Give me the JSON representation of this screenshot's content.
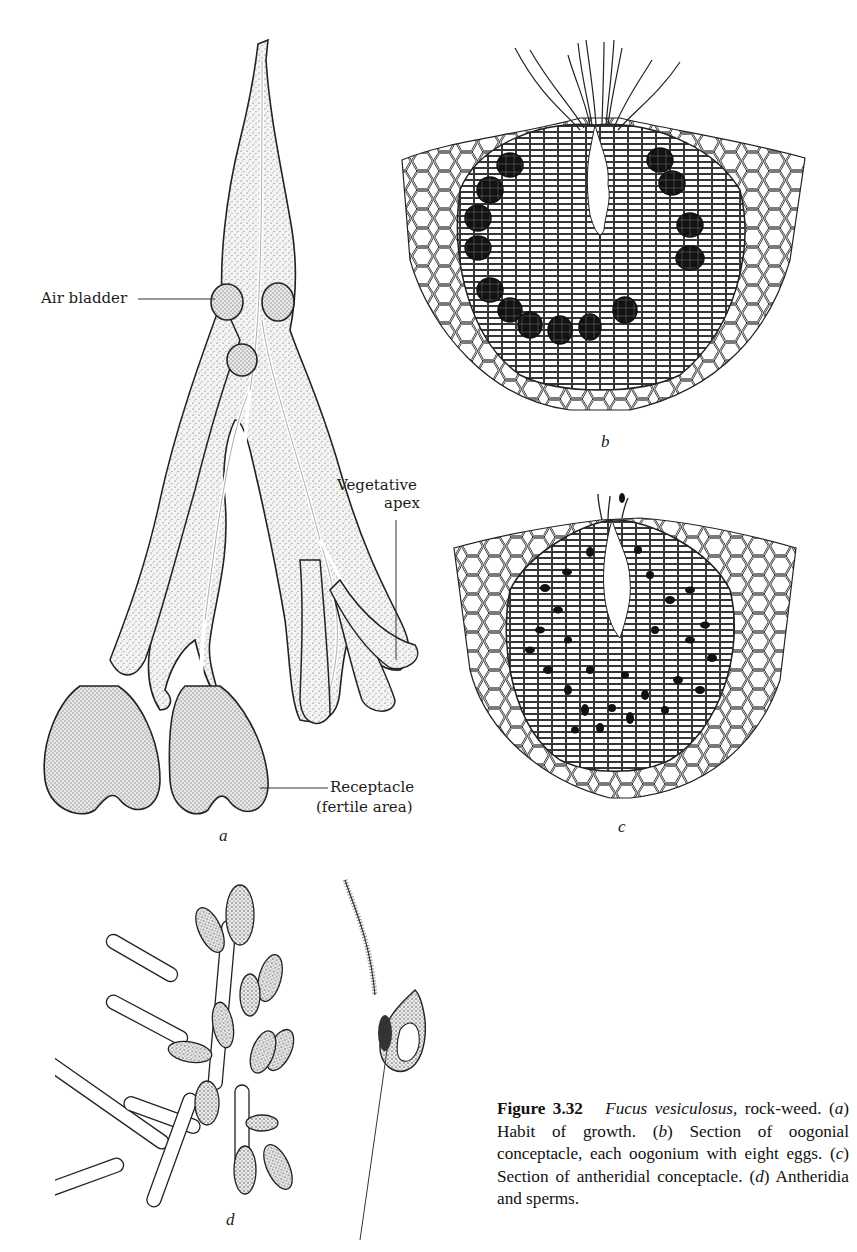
{
  "figure": {
    "number": "Figure 3.32",
    "species": "Fucus vesiculosus,",
    "caption_parts": {
      "intro_rest": " rock-weed. (",
      "a_letter": "a",
      "a_text": ") Habit of growth. (",
      "b_letter": "b",
      "b_text": ") Section of oogonial conceptacle, each oogonium with eight eggs. (",
      "c_letter": "c",
      "c_text": ") Section of antheridial conceptacle. (",
      "d_letter": "d",
      "d_text": ") Antheridia and sperms."
    }
  },
  "panels": {
    "a": {
      "letter": "a",
      "labels": {
        "air_bladder": "Air bladder",
        "vegetative_apex_line1": "Vegetative",
        "vegetative_apex_line2": "apex",
        "receptacle_line1": "Receptacle",
        "receptacle_line2": "(fertile area)"
      }
    },
    "b": {
      "letter": "b"
    },
    "c": {
      "letter": "c"
    },
    "d": {
      "letter": "d"
    }
  }
}
